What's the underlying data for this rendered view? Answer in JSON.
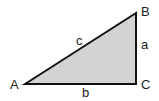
{
  "diagram": {
    "type": "right-triangle",
    "fill_color": "#d3d3d3",
    "stroke_color": "#111111",
    "vertices": {
      "A": {
        "label": "A",
        "x": 25,
        "y": 84
      },
      "B": {
        "label": "B",
        "x": 136,
        "y": 13
      },
      "C": {
        "label": "C",
        "x": 136,
        "y": 84
      }
    },
    "sides": {
      "a": {
        "label": "a",
        "between": "B-C"
      },
      "b": {
        "label": "b",
        "between": "A-C"
      },
      "c": {
        "label": "c",
        "between": "A-B"
      }
    }
  }
}
